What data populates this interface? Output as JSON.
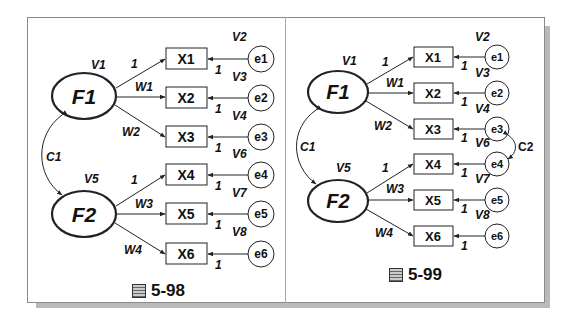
{
  "diagrams": [
    {
      "caption_prefix": "圖",
      "caption": "5-98",
      "factors": [
        {
          "label": "F1",
          "variance": "V1"
        },
        {
          "label": "F2",
          "variance": "V5"
        }
      ],
      "factor_covariance": "C1",
      "indicators": [
        {
          "label": "X1",
          "loading": "1",
          "error": "e1",
          "error_path": "1",
          "error_variance": "V2"
        },
        {
          "label": "X2",
          "loading": "W1",
          "error": "e2",
          "error_path": "1",
          "error_variance": "V3"
        },
        {
          "label": "X3",
          "loading": "W2",
          "error": "e3",
          "error_path": "1",
          "error_variance": "V4"
        },
        {
          "label": "X4",
          "loading": "1",
          "error": "e4",
          "error_path": "1",
          "error_variance": "V6"
        },
        {
          "label": "X5",
          "loading": "W3",
          "error": "e5",
          "error_path": "1",
          "error_variance": "V7"
        },
        {
          "label": "X6",
          "loading": "W4",
          "error": "e6",
          "error_path": "1",
          "error_variance": "V8"
        }
      ]
    },
    {
      "caption_prefix": "圖",
      "caption": "5-99",
      "factors": [
        {
          "label": "F1",
          "variance": "V1"
        },
        {
          "label": "F2",
          "variance": "V5"
        }
      ],
      "factor_covariance": "C1",
      "error_covariance": "C2",
      "indicators": [
        {
          "label": "X1",
          "loading": "1",
          "error": "e1",
          "error_path": "1",
          "error_variance": "V2"
        },
        {
          "label": "X2",
          "loading": "W1",
          "error": "e2",
          "error_path": "1",
          "error_variance": "V3"
        },
        {
          "label": "X3",
          "loading": "W2",
          "error": "e3",
          "error_path": "1",
          "error_variance": "V4"
        },
        {
          "label": "X4",
          "loading": "1",
          "error": "e4",
          "error_path": "1",
          "error_variance": "V6"
        },
        {
          "label": "X5",
          "loading": "W3",
          "error": "e5",
          "error_path": "1",
          "error_variance": "V7"
        },
        {
          "label": "X6",
          "loading": "W4",
          "error": "e6",
          "error_path": "1",
          "error_variance": "V8"
        }
      ]
    }
  ],
  "colors": {
    "stroke": "#222222",
    "frame": "#8a8a8a",
    "shadow": "#b9b9b9"
  }
}
